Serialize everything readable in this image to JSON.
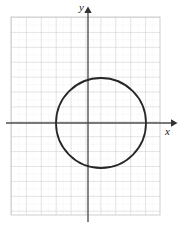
{
  "figure": {
    "width": 181,
    "height": 230,
    "background": "#ffffff"
  },
  "axes": {
    "x_label": "x",
    "y_label": "y",
    "x_axis_color": "#4d4d4d",
    "y_axis_color": "#4d4d4d",
    "x_axis_pixel_y": 123,
    "y_axis_pixel_x": 88,
    "x_arrow_tip_px": 176,
    "y_arrow_tip_px": 8
  },
  "grid": {
    "left_px": 11,
    "top_px": 17,
    "right_px": 160,
    "bottom_px": 215,
    "major_spacing_px": 14.9,
    "minor_divisions": 2,
    "major_color": "#c8c8c8",
    "minor_color": "#dcdcdc",
    "major_columns": 10,
    "major_rows": 13,
    "show_grid": true
  },
  "chart_data": {
    "type": "scatter",
    "title": "",
    "subtitle": "",
    "xlabel": "x",
    "ylabel": "y",
    "xlim": [
      -5.2,
      4.8
    ],
    "ylim": [
      -6.2,
      7.1
    ],
    "grid": true,
    "legend": null,
    "legend_position": "none",
    "tick_labels_x": [],
    "tick_labels_y": [],
    "annotations": [],
    "series": [
      {
        "name": "circle",
        "type": "circle",
        "center_x": 0.87,
        "center_y": 0.0,
        "radius": 3.0,
        "center_px_x": 101,
        "center_px_y": 123,
        "radius_px": 45,
        "stroke": "#262626",
        "stroke_width": 1.8,
        "fill": "none"
      }
    ]
  }
}
